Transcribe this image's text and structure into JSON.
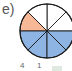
{
  "problem": {
    "label": "e)",
    "caption_numbers": [
      "4",
      "1"
    ]
  },
  "diagram": {
    "type": "fraction-circle",
    "total_sectors": 8,
    "sectors": [
      {
        "index": 0,
        "start_deg": 0,
        "color": "#ffffff"
      },
      {
        "index": 1,
        "start_deg": 45,
        "color": "#ffffff"
      },
      {
        "index": 2,
        "start_deg": 90,
        "color": "#ffffff"
      },
      {
        "index": 3,
        "start_deg": 135,
        "color": "#f6b896"
      },
      {
        "index": 4,
        "start_deg": 180,
        "color": "#8db4e2"
      },
      {
        "index": 5,
        "start_deg": 225,
        "color": "#8db4e2"
      },
      {
        "index": 6,
        "start_deg": 270,
        "color": "#8db4e2"
      },
      {
        "index": 7,
        "start_deg": 315,
        "color": "#8db4e2"
      }
    ],
    "shaded_orange": 1,
    "shaded_blue": 4,
    "colors": {
      "orange": "#f6b896",
      "blue": "#8db4e2",
      "outline": "#1a1a1a"
    }
  }
}
